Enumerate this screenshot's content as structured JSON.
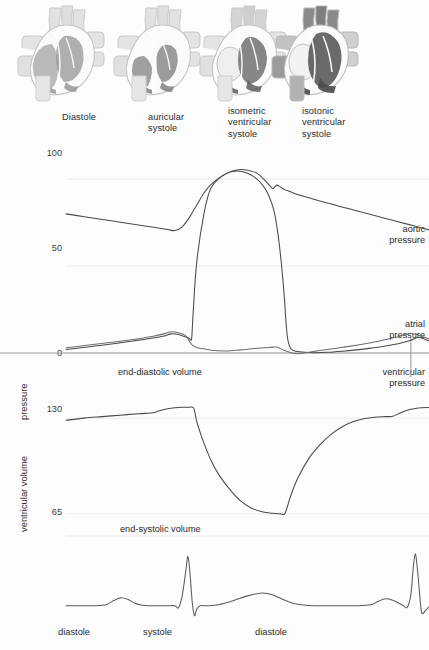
{
  "hearts": {
    "items": [
      {
        "id": "diastole",
        "label": "Diastole",
        "fill_tone": "light",
        "x": 14
      },
      {
        "id": "auricular-systole",
        "label": "auricular\nsystole",
        "fill_tone": "light",
        "x": 110
      },
      {
        "id": "isometric-systole",
        "label": "isometric\nventricular\nsystole",
        "fill_tone": "medium",
        "x": 196
      },
      {
        "id": "isotonic-systole",
        "label": "isotonic\nventricular\nsystole",
        "fill_tone": "dark",
        "x": 268
      }
    ],
    "label_positions": [
      62,
      148,
      228,
      302
    ]
  },
  "colors": {
    "curve": "#4a4a4a",
    "curve_light": "#6e6e6e",
    "grid": "#ededed",
    "axis": "#9a9a9a",
    "text": "#2b2b2b",
    "heart_outline": "#c9c9c9",
    "heart_light": "#d8d8d8",
    "heart_medium": "#9e9e9e",
    "heart_dark": "#6a6a6a",
    "background": "#fdfdfd"
  },
  "chart_data": [
    {
      "id": "pressure-chart",
      "type": "line",
      "title": "",
      "ylabel": "pressure",
      "xlabel": "",
      "ylim": [
        0,
        115
      ],
      "yticks": [
        0,
        50,
        100
      ],
      "ytick_labels": [
        "0",
        "50",
        "100"
      ],
      "grid": true,
      "xlim": [
        0,
        100
      ],
      "annotations": [
        {
          "text": "aortic\npressure",
          "x": 97,
          "y": 72,
          "align": "right"
        },
        {
          "text": "atrial\npressure",
          "x": 97,
          "y": 22,
          "align": "right"
        },
        {
          "text": "ventricular\npressure",
          "x": 97,
          "y": -9,
          "align": "right"
        },
        {
          "text": "end-diastolic volume",
          "x": 40,
          "y": -7,
          "align": "center"
        }
      ],
      "series": [
        {
          "name": "aortic pressure",
          "color": "#4a4a4a",
          "x": [
            0,
            5,
            10,
            15,
            20,
            25,
            28,
            30,
            32,
            34,
            36,
            38,
            40,
            44,
            48,
            52,
            54,
            56,
            57,
            58,
            59,
            60,
            61,
            62,
            64,
            68,
            72,
            76,
            80,
            84,
            88,
            92,
            96,
            100
          ],
          "y": [
            80,
            78.4,
            76.8,
            75.2,
            73.6,
            72.0,
            71.0,
            70.4,
            72.5,
            78,
            85,
            92,
            97,
            103,
            105.5,
            104,
            101,
            96.5,
            94.5,
            96.5,
            95.5,
            94.2,
            93.4,
            92.6,
            91.0,
            88.6,
            86.2,
            84.0,
            81.8,
            79.6,
            77.4,
            75.2,
            73.0,
            70.8
          ]
        },
        {
          "name": "ventricular pressure",
          "color": "#4a4a4a",
          "x": [
            0,
            4,
            8,
            12,
            16,
            20,
            24,
            27,
            29,
            31,
            33,
            34,
            34.6,
            35,
            36,
            38,
            40,
            44,
            48,
            52,
            55,
            57,
            58,
            59,
            60,
            60.6,
            61,
            61.5,
            62,
            63,
            65,
            68,
            72,
            76,
            80,
            84,
            88,
            92,
            95,
            97,
            98.5,
            100
          ],
          "y": [
            2.0,
            3.0,
            4.0,
            5.0,
            6.2,
            7.4,
            8.6,
            9.8,
            11.0,
            10.6,
            9.2,
            8.4,
            8.2,
            22,
            52,
            80,
            95,
            103,
            104.5,
            101,
            94,
            84,
            74,
            58,
            36,
            18,
            9,
            4.5,
            2.2,
            1.2,
            0.6,
            0.2,
            0.4,
            1.0,
            1.8,
            2.8,
            4.0,
            5.6,
            7.4,
            9.0,
            8.2,
            7.0
          ]
        },
        {
          "name": "atrial pressure",
          "color": "#6e6e6e",
          "x": [
            0,
            4,
            8,
            12,
            16,
            20,
            24,
            27,
            29,
            31,
            33,
            34.6,
            36,
            38,
            40,
            44,
            48,
            52,
            56,
            58,
            60,
            62,
            64,
            66,
            70,
            74,
            78,
            82,
            86,
            90,
            93,
            95,
            97,
            98.5,
            100
          ],
          "y": [
            3.0,
            4.0,
            5.0,
            6.0,
            7.0,
            8.2,
            9.6,
            11.0,
            12.2,
            11.6,
            9.8,
            5.0,
            3.2,
            2.4,
            1.6,
            1.2,
            1.8,
            2.6,
            3.2,
            3.4,
            1.6,
            0.2,
            -0.4,
            0.2,
            1.4,
            2.6,
            3.8,
            5.2,
            6.8,
            8.6,
            10.2,
            11.2,
            10.4,
            9.2,
            8.2
          ]
        }
      ]
    },
    {
      "id": "volume-chart",
      "type": "line",
      "title": "",
      "ylabel": "ventricular volume",
      "xlabel": "",
      "ylim": [
        50,
        145
      ],
      "yticks": [
        65,
        130
      ],
      "ytick_labels": [
        "65",
        "130"
      ],
      "grid": true,
      "xlim": [
        0,
        100
      ],
      "annotations": [
        {
          "text": "end-systolic volume",
          "x": 40,
          "y": 56,
          "align": "center"
        }
      ],
      "series": [
        {
          "name": "ventricular volume",
          "color": "#4a4a4a",
          "x": [
            0,
            5,
            10,
            15,
            20,
            24,
            26,
            28,
            30,
            32,
            34,
            34.8,
            35.3,
            36,
            37,
            38,
            40,
            42,
            45,
            48,
            51,
            54,
            57,
            59,
            60.2,
            61,
            62,
            64,
            67,
            70,
            73,
            76,
            79,
            82,
            85,
            88,
            90,
            92,
            94,
            96,
            98,
            100
          ],
          "y": [
            128.5,
            130.0,
            131.0,
            132.0,
            133.0,
            133.6,
            135.2,
            136.4,
            137.0,
            137.3,
            137.4,
            137.4,
            136.0,
            128,
            120,
            113,
            101,
            92,
            82,
            74,
            69,
            66.5,
            65.4,
            65.1,
            65.0,
            70,
            78,
            90,
            103,
            112,
            119,
            124,
            127.5,
            129.5,
            130.6,
            131.0,
            131.2,
            133.4,
            135.4,
            136.4,
            137.0,
            137.2
          ]
        }
      ]
    },
    {
      "id": "ecg-chart",
      "type": "line",
      "title": "",
      "ylabel": "",
      "xlabel": "",
      "ylim": [
        -0.45,
        1.25
      ],
      "yticks": [],
      "ytick_labels": [],
      "grid": false,
      "xlim": [
        0,
        100
      ],
      "phase_labels": [
        {
          "text": "diastole",
          "x": 5
        },
        {
          "text": "systole",
          "x": 29
        },
        {
          "text": "diastole",
          "x": 59
        }
      ],
      "series": [
        {
          "name": "ECG",
          "color": "#5a5a5a",
          "waves": "P-QRS-T",
          "x": [
            0,
            4,
            8,
            11,
            13,
            15,
            17,
            19,
            21,
            23,
            26,
            28,
            30,
            31,
            32,
            33,
            33.6,
            34.2,
            34.8,
            35.4,
            36,
            37,
            39,
            42,
            46,
            50,
            54,
            57,
            60,
            63,
            66,
            70,
            75,
            80,
            84,
            86,
            88,
            90,
            92,
            93,
            94,
            95,
            95.6,
            96.2,
            96.8,
            97.4,
            98,
            99,
            100
          ],
          "y": [
            0,
            0,
            0,
            0.02,
            0.1,
            0.16,
            0.13,
            0.05,
            0.01,
            0,
            0,
            0,
            0,
            -0.04,
            0.2,
            0.7,
            1.0,
            0.62,
            0.05,
            -0.2,
            -0.07,
            0,
            0,
            0.02,
            0.1,
            0.2,
            0.26,
            0.22,
            0.12,
            0.04,
            0.01,
            0,
            0,
            0,
            0.02,
            0.09,
            0.14,
            0.11,
            0.04,
            0,
            -0.03,
            0.22,
            0.72,
            1.05,
            0.75,
            0.25,
            -0.14,
            -0.1,
            -0.02
          ]
        }
      ]
    }
  ]
}
